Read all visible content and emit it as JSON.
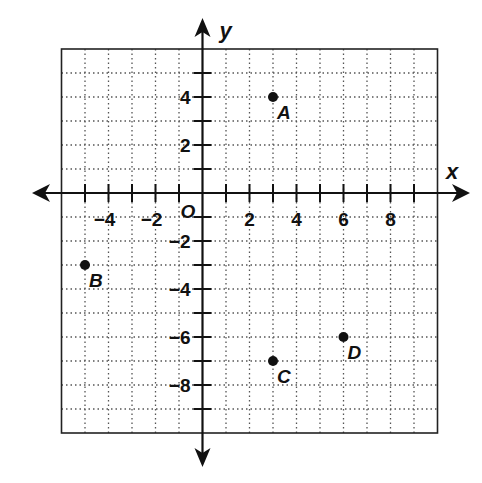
{
  "axes": {
    "x_label": "x",
    "y_label": "y",
    "origin_label": "O",
    "x_range": [
      -6,
      10
    ],
    "y_range": [
      -10,
      6
    ],
    "x_tick_labels": [
      {
        "value": -4,
        "text": "−4"
      },
      {
        "value": -2,
        "text": "−2"
      },
      {
        "value": 2,
        "text": "2"
      },
      {
        "value": 4,
        "text": "4"
      },
      {
        "value": 6,
        "text": "6"
      },
      {
        "value": 8,
        "text": "8"
      }
    ],
    "y_tick_labels": [
      {
        "value": 4,
        "text": "4"
      },
      {
        "value": 2,
        "text": "2"
      },
      {
        "value": -2,
        "text": "−2"
      },
      {
        "value": -4,
        "text": "−4"
      },
      {
        "value": -6,
        "text": "−6"
      },
      {
        "value": -8,
        "text": "−8"
      }
    ]
  },
  "points": [
    {
      "label": "A",
      "x": 3,
      "y": 4
    },
    {
      "label": "B",
      "x": -5,
      "y": -3
    },
    {
      "label": "C",
      "x": 3,
      "y": -7
    },
    {
      "label": "D",
      "x": 6,
      "y": -6
    }
  ],
  "colors": {
    "ink": "#111111",
    "grid": "#555555",
    "background": "#ffffff"
  }
}
